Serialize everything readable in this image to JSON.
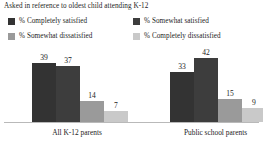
{
  "note": "Asked in reference to oldest child attending K-12",
  "legend": [
    {
      "label": "% Completely satisfied",
      "color": "#333333"
    },
    {
      "label": "% Somewhat satisfied",
      "color": "#3d3d3d"
    },
    {
      "label": "% Somewhat dissatisfied",
      "color": "#9a9a9a"
    },
    {
      "label": "% Completely dissatisfied",
      "color": "#c9c9c9"
    }
  ],
  "chart_data": {
    "type": "bar",
    "title": "Asked in reference to oldest child attending K-12",
    "xlabel": "",
    "ylabel": "",
    "ylim": [
      0,
      50
    ],
    "grid": false,
    "legend_position": "top",
    "categories": [
      "All K-12 parents",
      "Public school parents"
    ],
    "series": [
      {
        "name": "% Completely satisfied",
        "color": "#333333",
        "values": [
          39,
          37
        ]
      },
      {
        "name": "% Somewhat satisfied",
        "color": "#3d3d3d",
        "values": [
          37,
          42
        ]
      },
      {
        "name": "% Somewhat dissatisfied",
        "color": "#9a9a9a",
        "values": [
          14,
          15
        ]
      },
      {
        "name": "% Completely dissatisfied",
        "color": "#c9c9c9",
        "values": [
          7,
          9
        ]
      }
    ],
    "groups": [
      {
        "label": "All K-12 parents",
        "bars": [
          {
            "series": "% Completely satisfied",
            "value": 39,
            "value_label": "39",
            "color": "#333333"
          },
          {
            "series": "% Somewhat satisfied",
            "value": 37,
            "value_label": "37",
            "color": "#3d3d3d"
          },
          {
            "series": "% Somewhat dissatisfied",
            "value": 14,
            "value_label": "14",
            "color": "#9a9a9a"
          },
          {
            "series": "% Completely dissatisfied",
            "value": 7,
            "value_label": "7",
            "color": "#c9c9c9"
          }
        ]
      },
      {
        "label": "Public school parents",
        "bars": [
          {
            "series": "% Completely satisfied",
            "value": 33,
            "value_label": "33",
            "color": "#333333"
          },
          {
            "series": "% Somewhat satisfied",
            "value": 42,
            "value_label": "42",
            "color": "#3d3d3d"
          },
          {
            "series": "% Somewhat dissatisfied",
            "value": 15,
            "value_label": "15",
            "color": "#9a9a9a"
          },
          {
            "series": "% Completely dissatisfied",
            "value": 9,
            "value_label": "9",
            "color": "#c9c9c9"
          }
        ]
      }
    ]
  },
  "axis": {
    "baseline_color": "#b9b9b9"
  }
}
